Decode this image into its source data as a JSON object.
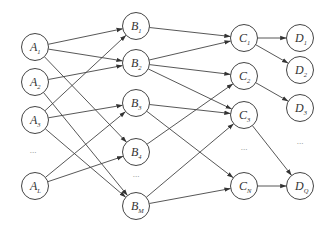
{
  "diagram": {
    "type": "layered-directed-graph",
    "layers": [
      {
        "name": "A",
        "nodes": [
          {
            "id": "A1",
            "base": "A",
            "sub": "1",
            "x": 35,
            "y": 47
          },
          {
            "id": "A2",
            "base": "A",
            "sub": "2",
            "x": 35,
            "y": 82
          },
          {
            "id": "A3",
            "base": "A",
            "sub": "3",
            "x": 35,
            "y": 120
          },
          {
            "id": "AL",
            "base": "A",
            "sub": "L",
            "x": 35,
            "y": 186
          }
        ],
        "ellipsis": {
          "text": "...",
          "x": 33,
          "y": 153
        }
      },
      {
        "name": "B",
        "nodes": [
          {
            "id": "B1",
            "base": "B",
            "sub": "1",
            "x": 136,
            "y": 26
          },
          {
            "id": "B2",
            "base": "B",
            "sub": "2",
            "x": 136,
            "y": 63
          },
          {
            "id": "B3",
            "base": "B",
            "sub": "3",
            "x": 136,
            "y": 103
          },
          {
            "id": "B4",
            "base": "B",
            "sub": "4",
            "x": 136,
            "y": 152
          },
          {
            "id": "BM",
            "base": "B",
            "sub": "M",
            "x": 136,
            "y": 206
          }
        ],
        "ellipsis": {
          "text": "...",
          "x": 136,
          "y": 177
        }
      },
      {
        "name": "C",
        "nodes": [
          {
            "id": "C1",
            "base": "C",
            "sub": "1",
            "x": 244,
            "y": 38
          },
          {
            "id": "C2",
            "base": "C",
            "sub": "2",
            "x": 244,
            "y": 76
          },
          {
            "id": "C3",
            "base": "C",
            "sub": "3",
            "x": 244,
            "y": 115
          },
          {
            "id": "CN",
            "base": "C",
            "sub": "N",
            "x": 244,
            "y": 186
          }
        ],
        "ellipsis": {
          "text": "...",
          "x": 244,
          "y": 150
        }
      },
      {
        "name": "D",
        "nodes": [
          {
            "id": "D1",
            "base": "D",
            "sub": "1",
            "x": 300,
            "y": 38
          },
          {
            "id": "D2",
            "base": "D",
            "sub": "2",
            "x": 300,
            "y": 70
          },
          {
            "id": "D3",
            "base": "D",
            "sub": "3",
            "x": 300,
            "y": 108
          },
          {
            "id": "DQ",
            "base": "D",
            "sub": "Q",
            "x": 300,
            "y": 186
          }
        ],
        "ellipsis": {
          "text": "...",
          "x": 300,
          "y": 144
        }
      }
    ],
    "edges": [
      [
        "A1",
        "B1"
      ],
      [
        "A1",
        "B2"
      ],
      [
        "A1",
        "B4"
      ],
      [
        "A2",
        "B2"
      ],
      [
        "A2",
        "BM"
      ],
      [
        "A3",
        "B1"
      ],
      [
        "A3",
        "B3"
      ],
      [
        "A3",
        "BM"
      ],
      [
        "AL",
        "B3"
      ],
      [
        "AL",
        "B4"
      ],
      [
        "B1",
        "C1"
      ],
      [
        "B2",
        "C1"
      ],
      [
        "B2",
        "C2"
      ],
      [
        "B2",
        "C3"
      ],
      [
        "B3",
        "C3"
      ],
      [
        "B3",
        "CN"
      ],
      [
        "B4",
        "C2"
      ],
      [
        "BM",
        "C3"
      ],
      [
        "BM",
        "CN"
      ],
      [
        "C1",
        "D1"
      ],
      [
        "C1",
        "D2"
      ],
      [
        "C2",
        "D3"
      ],
      [
        "C3",
        "DQ"
      ],
      [
        "CN",
        "DQ"
      ]
    ],
    "style": {
      "node_radius": 13.5,
      "stroke": "#444444",
      "background": "#ffffff"
    }
  }
}
